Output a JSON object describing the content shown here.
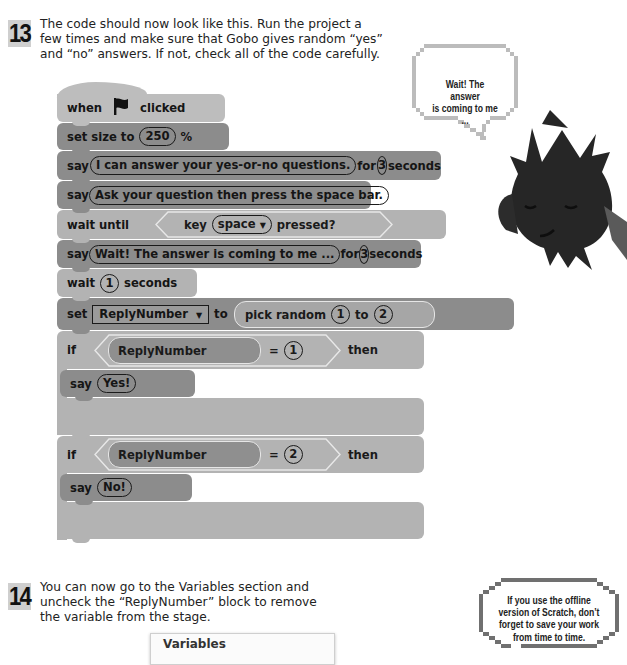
{
  "step13": {
    "number": "13",
    "text_lines": [
      "The code should now look like this. Run the project a",
      "few times and make sure that Gobo gives random “yes”",
      "and “no” answers. If not, check all of the code carefully."
    ]
  },
  "script": {
    "hat": {
      "when": "when",
      "flag_icon": "green-flag",
      "clicked": "clicked"
    },
    "set_size": {
      "label": "set size to",
      "value": "250",
      "unit": "%"
    },
    "say_for_1": {
      "say": "say",
      "message": "I can answer your yes-or-no questions.",
      "for": "for",
      "secs": "3",
      "seconds": "seconds"
    },
    "say_1": {
      "say": "say",
      "message": "Ask your question then press the space bar."
    },
    "wait_until": {
      "label": "wait until",
      "key": "key",
      "key_value": "space",
      "pressed": "pressed?"
    },
    "say_for_2": {
      "say": "say",
      "message": "Wait! The answer is coming to me ...",
      "for": "for",
      "secs": "3",
      "seconds": "seconds"
    },
    "wait": {
      "label": "wait",
      "secs": "1",
      "seconds": "seconds"
    },
    "set_var": {
      "set": "set",
      "variable": "ReplyNumber",
      "to": "to",
      "pick": "pick random",
      "from": "1",
      "to2": "to",
      "max": "2"
    },
    "if1": {
      "if": "if",
      "variable": "ReplyNumber",
      "eq": "=",
      "value": "1",
      "then": "then",
      "say": "say",
      "message": "Yes!"
    },
    "if2": {
      "if": "if",
      "variable": "ReplyNumber",
      "eq": "=",
      "value": "2",
      "then": "then",
      "say": "say",
      "message": "No!"
    }
  },
  "speech_bubble": {
    "lines": [
      "Wait! The answer",
      "is coming to me ..."
    ]
  },
  "sprite": {
    "name": "Gobo"
  },
  "step14": {
    "number": "14",
    "text_lines": [
      "You can now go to the Variables section and",
      "uncheck the “ReplyNumber” block to remove",
      "the variable from the stage."
    ]
  },
  "variables_panel": {
    "title": "Variables"
  },
  "tip": {
    "lines": [
      "If you use the offline",
      "version of Scratch, don’t",
      "forget to save your work",
      "from time to time."
    ]
  },
  "colors": {
    "looks_block": "#8c8c8c",
    "control_block": "#b3b3b3",
    "event_hat": "#bdbdbd",
    "data_block": "#8c8c8c",
    "badge": "#cfcfcf"
  }
}
